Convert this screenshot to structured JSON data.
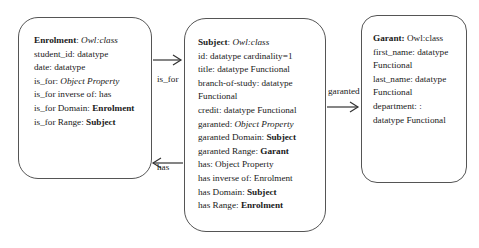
{
  "classes": {
    "enrolment": {
      "lines": [
        {
          "bold": "Enrolment",
          "plain": ": ",
          "italic": "Owl:class"
        },
        {
          "plain": "student_id: datatype"
        },
        {
          "plain": "date:  datatype"
        },
        {
          "plain": "is_for:  ",
          "italic": "Object Property"
        },
        {
          "plain": "is_for inverse of: has"
        },
        {
          "plain": "is_for Domain: ",
          "bold2": "Enrolment"
        },
        {
          "plain": "is_for Range:  ",
          "bold2": "Subject"
        }
      ]
    },
    "subject": {
      "lines": [
        {
          "bold": "Subject",
          "plain": ": ",
          "italic": "Owl:class"
        },
        {
          "plain": "id: datatype cardinality=1"
        },
        {
          "plain": "title: datatype Functional"
        },
        {
          "plain": "branch-of-study: datatype"
        },
        {
          "plain": "Functional"
        },
        {
          "plain": "credit: datatype Functional"
        },
        {
          "plain": "garanted: ",
          "italic": "Object Property"
        },
        {
          "plain": "garanted Domain: ",
          "bold2": "Subject"
        },
        {
          "plain": "garanted Range: ",
          "bold2": "Garant"
        },
        {
          "plain": "has: Object Property"
        },
        {
          "plain": "has inverse of: Enrolment"
        },
        {
          "plain": "has Domain: ",
          "bold2": "Subject"
        },
        {
          "plain": "has Range: ",
          "bold2": "Enrolment"
        }
      ]
    },
    "garant": {
      "lines": [
        {
          "bold": "Garant:",
          "plain": " Owl:class"
        },
        {
          "plain": "first_name: datatype"
        },
        {
          "plain": "Functional"
        },
        {
          "plain": "last_name: datatype"
        },
        {
          "plain": "Functional"
        },
        {
          "plain": "department: :"
        },
        {
          "plain": "datatype Functional"
        }
      ]
    }
  },
  "edges": {
    "is_for": "is_for",
    "has": "has",
    "garanted": "garanted"
  },
  "colors": {
    "line": "#333333",
    "border": "#555555"
  }
}
